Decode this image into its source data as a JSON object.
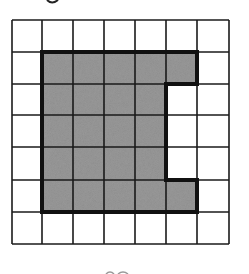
{
  "diagram": {
    "type": "grid-area-figure",
    "grid": {
      "columns": 7,
      "rows": 7,
      "x_lines": [
        12,
        42,
        73,
        104,
        135,
        166,
        197,
        229
      ],
      "y_lines": [
        20,
        52,
        84,
        115,
        147,
        180,
        212,
        244
      ],
      "line_color": "#1a1a1a",
      "background": "#ffffff"
    },
    "shaded_shape": {
      "description": "Shaded region spanning columns 1-5 and rows 1-5 with a rectangular notch removed from column 5, rows 2-4",
      "fill": "#8c8c8c",
      "outline_color": "#111111",
      "shaded_cells_count": 22,
      "cells": [
        [
          1,
          1
        ],
        [
          2,
          1
        ],
        [
          3,
          1
        ],
        [
          4,
          1
        ],
        [
          5,
          1
        ],
        [
          1,
          2
        ],
        [
          2,
          2
        ],
        [
          3,
          2
        ],
        [
          4,
          2
        ],
        [
          1,
          3
        ],
        [
          2,
          3
        ],
        [
          3,
          3
        ],
        [
          4,
          3
        ],
        [
          1,
          4
        ],
        [
          2,
          4
        ],
        [
          3,
          4
        ],
        [
          4,
          4
        ],
        [
          1,
          5
        ],
        [
          2,
          5
        ],
        [
          3,
          5
        ],
        [
          4,
          5
        ],
        [
          5,
          5
        ]
      ]
    },
    "cropped_fragments": [
      {
        "position": "top-left",
        "note": "partial glyph cut off at top edge"
      },
      {
        "position": "bottom-center",
        "note": "partial glyph cut off at bottom edge"
      }
    ]
  }
}
